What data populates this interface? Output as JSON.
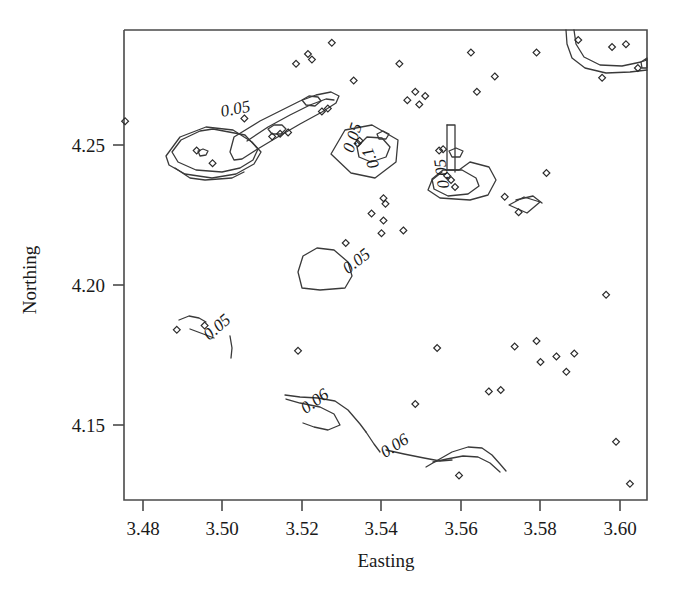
{
  "figure": {
    "type": "contour-scatter-plot",
    "background_color": "#ffffff",
    "line_color": "#3a3a3a",
    "text_color": "#1a1a1a"
  },
  "axes": {
    "x_title": "Easting",
    "y_title": "Northing",
    "x_ticks": [
      "3.48",
      "3.50",
      "3.52",
      "3.54",
      "3.56",
      "3.58",
      "3.60"
    ],
    "y_ticks": [
      "4.25",
      "4.20",
      "4.15"
    ]
  },
  "chart_data": {
    "type": "scatter",
    "title": "",
    "xlabel": "Easting",
    "ylabel": "Northing",
    "xlim": [
      3.4715,
      3.6075
    ],
    "ylim": [
      4.1215,
      4.2885
    ],
    "grid": false,
    "legend": "none",
    "x_tick_values": [
      3.48,
      3.5,
      3.52,
      3.54,
      3.56,
      3.58,
      3.6
    ],
    "y_tick_values": [
      4.25,
      4.2,
      4.15
    ],
    "points": [
      {
        "x": 3.4755,
        "y": 4.2585
      },
      {
        "x": 3.4935,
        "y": 4.248
      },
      {
        "x": 3.4975,
        "y": 4.2435
      },
      {
        "x": 3.5055,
        "y": 4.2595
      },
      {
        "x": 3.5125,
        "y": 4.253
      },
      {
        "x": 3.5145,
        "y": 4.254
      },
      {
        "x": 3.5165,
        "y": 4.2545
      },
      {
        "x": 3.5185,
        "y": 4.279
      },
      {
        "x": 3.5215,
        "y": 4.2825
      },
      {
        "x": 3.5225,
        "y": 4.2805
      },
      {
        "x": 3.525,
        "y": 4.262
      },
      {
        "x": 3.5265,
        "y": 4.263
      },
      {
        "x": 3.5275,
        "y": 4.2865
      },
      {
        "x": 3.533,
        "y": 4.273
      },
      {
        "x": 3.534,
        "y": 4.2505
      },
      {
        "x": 3.5345,
        "y": 4.2515
      },
      {
        "x": 3.5405,
        "y": 4.231
      },
      {
        "x": 3.541,
        "y": 4.229
      },
      {
        "x": 3.54,
        "y": 4.2185
      },
      {
        "x": 3.5445,
        "y": 4.279
      },
      {
        "x": 3.5465,
        "y": 4.266
      },
      {
        "x": 3.5485,
        "y": 4.269
      },
      {
        "x": 3.5495,
        "y": 4.2645
      },
      {
        "x": 3.551,
        "y": 4.2675
      },
      {
        "x": 3.5545,
        "y": 4.248
      },
      {
        "x": 3.5555,
        "y": 4.2485
      },
      {
        "x": 3.5565,
        "y": 4.239
      },
      {
        "x": 3.5575,
        "y": 4.2375
      },
      {
        "x": 3.5585,
        "y": 4.235
      },
      {
        "x": 3.5625,
        "y": 4.283
      },
      {
        "x": 3.564,
        "y": 4.269
      },
      {
        "x": 3.5685,
        "y": 4.2745
      },
      {
        "x": 3.571,
        "y": 4.2315
      },
      {
        "x": 3.5745,
        "y": 4.226
      },
      {
        "x": 3.579,
        "y": 4.283
      },
      {
        "x": 3.5815,
        "y": 4.24
      },
      {
        "x": 3.5895,
        "y": 4.2875
      },
      {
        "x": 3.5955,
        "y": 4.274
      },
      {
        "x": 3.598,
        "y": 4.285
      },
      {
        "x": 3.6015,
        "y": 4.286
      },
      {
        "x": 3.6045,
        "y": 4.2775
      },
      {
        "x": 3.4885,
        "y": 4.184
      },
      {
        "x": 3.4955,
        "y": 4.1855
      },
      {
        "x": 3.519,
        "y": 4.1765
      },
      {
        "x": 3.531,
        "y": 4.215
      },
      {
        "x": 3.5375,
        "y": 4.2255
      },
      {
        "x": 3.5405,
        "y": 4.223
      },
      {
        "x": 3.5455,
        "y": 4.2195
      },
      {
        "x": 3.5485,
        "y": 4.1575
      },
      {
        "x": 3.554,
        "y": 4.1775
      },
      {
        "x": 3.5595,
        "y": 4.132
      },
      {
        "x": 3.567,
        "y": 4.162
      },
      {
        "x": 3.57,
        "y": 4.1625
      },
      {
        "x": 3.5735,
        "y": 4.178
      },
      {
        "x": 3.579,
        "y": 4.18
      },
      {
        "x": 3.58,
        "y": 4.1725
      },
      {
        "x": 3.584,
        "y": 4.1745
      },
      {
        "x": 3.5865,
        "y": 4.169
      },
      {
        "x": 3.5885,
        "y": 4.1755
      },
      {
        "x": 3.5965,
        "y": 4.1965
      },
      {
        "x": 3.599,
        "y": 4.144
      },
      {
        "x": 3.6025,
        "y": 4.129
      }
    ],
    "contours": [
      {
        "level": 0.05,
        "label": "0.05",
        "label_count": 5
      },
      {
        "level": 0.06,
        "label": "0.06",
        "label_count": 2
      },
      {
        "level": 0.1,
        "label": "0.1",
        "label_count": 1
      }
    ],
    "contour_labels": [
      {
        "text": "0.05",
        "x": 3.5035,
        "y": 4.261,
        "rotation": -11
      },
      {
        "text": "0.05",
        "x": 3.534,
        "y": 4.252,
        "rotation": -72
      },
      {
        "text": "0.1",
        "x": 3.5385,
        "y": 4.246,
        "rotation": -112
      },
      {
        "text": "0.05",
        "x": 3.5565,
        "y": 4.24,
        "rotation": -98
      },
      {
        "text": "0.05",
        "x": 3.5345,
        "y": 4.207,
        "rotation": -38
      },
      {
        "text": "0.05",
        "x": 3.4995,
        "y": 4.1835,
        "rotation": -41
      },
      {
        "text": "0.06",
        "x": 3.524,
        "y": 4.157,
        "rotation": -36
      },
      {
        "text": "0.06",
        "x": 3.544,
        "y": 4.141,
        "rotation": -33
      }
    ]
  }
}
